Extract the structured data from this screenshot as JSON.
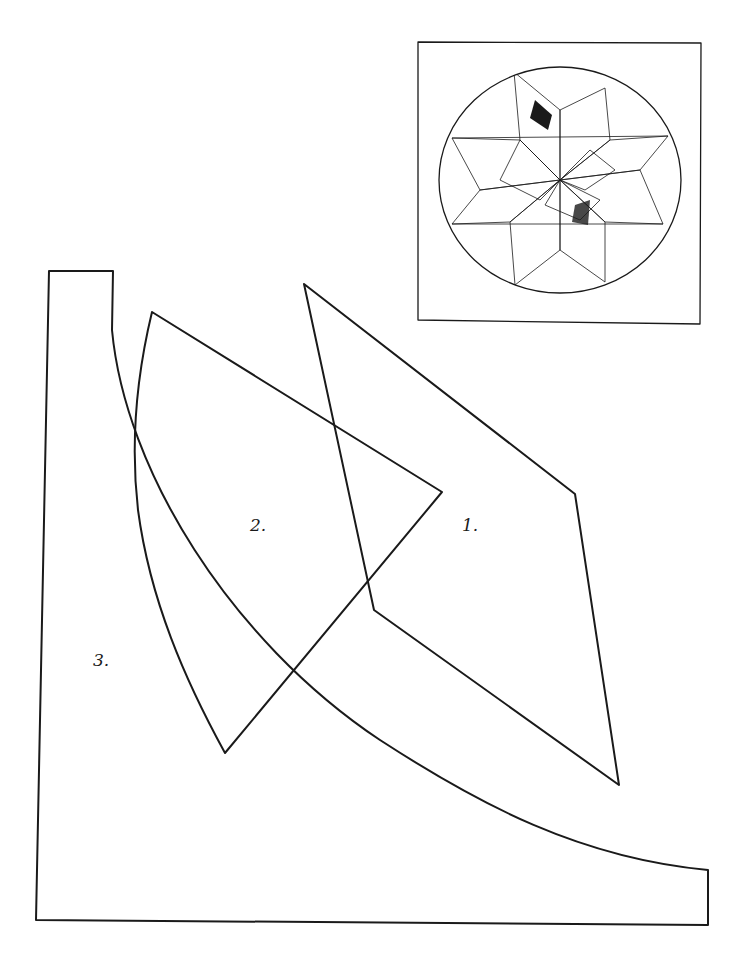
{
  "diagram": {
    "type": "quilt pattern template",
    "stroke_color": "#1a1a1a",
    "background": "#ffffff",
    "pieces": [
      {
        "id": "piece-1",
        "label": "1.",
        "shape": "diamond",
        "vertices": [
          [
            304,
            284
          ],
          [
            575,
            494
          ],
          [
            619,
            785
          ],
          [
            374,
            610
          ]
        ]
      },
      {
        "id": "piece-2",
        "label": "2.",
        "shape": "curved triangle",
        "vertices": [
          [
            152,
            312
          ],
          [
            442,
            492
          ],
          [
            225,
            753
          ]
        ]
      },
      {
        "id": "piece-3",
        "label": "3.",
        "shape": "curved corner",
        "vertices": [
          [
            49,
            271
          ],
          [
            113,
            271
          ],
          [
            708,
            870
          ],
          [
            708,
            925
          ],
          [
            36,
            920
          ]
        ]
      }
    ],
    "inset": {
      "description": "finished block preview: eight-pointed star in circle, crazy-quilt patchwork",
      "box": [
        418,
        42,
        701,
        324
      ]
    }
  }
}
